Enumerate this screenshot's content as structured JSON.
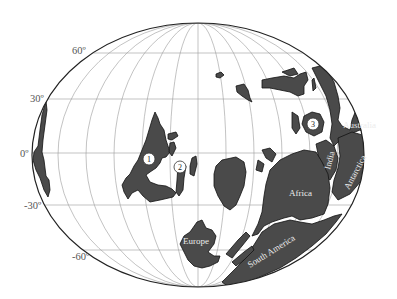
{
  "map": {
    "projection": "Mollweide-style ellipse",
    "colors": {
      "land": "#4a4a4a",
      "ocean": "#ffffff",
      "grid": "#9a9a9a",
      "outline": "#222222",
      "label_on_land": "#ececec"
    },
    "latitude_labels": [
      {
        "id": "lat-60",
        "text": "60º"
      },
      {
        "id": "lat-30",
        "text": "30º"
      },
      {
        "id": "lat-0",
        "text": "0º"
      },
      {
        "id": "lat-m30",
        "text": "-30º"
      },
      {
        "id": "lat-m60",
        "text": "-60º"
      }
    ],
    "continent_labels": {
      "australia": "Australia",
      "india": "India",
      "antarctica": "Antarctica",
      "africa": "Africa",
      "south_america": "South America",
      "europe": "Europe"
    },
    "markers": [
      {
        "id": "1",
        "text": "1"
      },
      {
        "id": "2",
        "text": "2"
      },
      {
        "id": "3",
        "text": "3"
      }
    ]
  }
}
